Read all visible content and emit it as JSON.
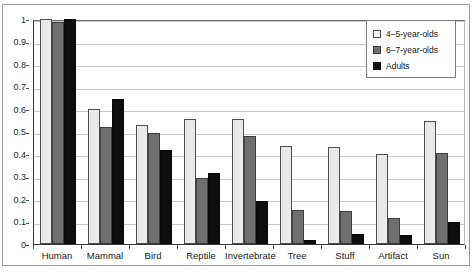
{
  "chart_data": {
    "type": "bar",
    "title": "",
    "xlabel": "",
    "ylabel": "",
    "ylim": [
      0,
      1
    ],
    "ytick_labels": [
      "1",
      "0.9",
      "0.8",
      "0.7",
      "0.6",
      "0.5",
      "0.4",
      "0.3",
      "0.2",
      "0.1",
      "0"
    ],
    "ytick_values": [
      1,
      0.9,
      0.8,
      0.7,
      0.6,
      0.5,
      0.4,
      0.3,
      0.2,
      0.1,
      0
    ],
    "grid": true,
    "legend_position": "top-right",
    "categories": [
      "Human",
      "Mammal",
      "Bird",
      "Reptile",
      "Invertebrate",
      "Tree",
      "Stuff",
      "Artifact",
      "Sun"
    ],
    "series": [
      {
        "name": "4–5-year-olds",
        "color": "#e9e9e9",
        "values": [
          1.0,
          0.6,
          0.53,
          0.555,
          0.555,
          0.435,
          0.43,
          0.4,
          0.545
        ]
      },
      {
        "name": "6–7-year-olds",
        "color": "#6f6f6f",
        "values": [
          0.985,
          0.52,
          0.495,
          0.295,
          0.48,
          0.15,
          0.145,
          0.115,
          0.405
        ]
      },
      {
        "name": "Adults",
        "color": "#0e0e0e",
        "values": [
          1.0,
          0.645,
          0.42,
          0.315,
          0.19,
          0.02,
          0.045,
          0.04,
          0.1
        ]
      }
    ]
  },
  "legend": {
    "entries": [
      {
        "label": "4–5-year-olds"
      },
      {
        "label": "6–7-year-olds"
      },
      {
        "label": "Adults"
      }
    ]
  }
}
